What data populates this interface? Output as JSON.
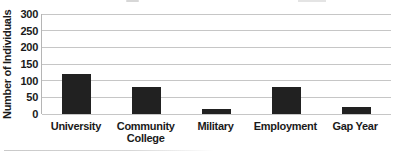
{
  "figure": {
    "background": "#ffffff"
  },
  "chart_data": {
    "type": "bar",
    "title": "",
    "categories": [
      "University",
      "Community College",
      "Military",
      "Employment",
      "Gap Year"
    ],
    "values": [
      120,
      80,
      15,
      80,
      20
    ],
    "xlabel": "",
    "ylabel": "Number of Individuals",
    "ylim": [
      0,
      300
    ],
    "yticks": [
      0,
      50,
      100,
      150,
      200,
      250,
      300
    ],
    "grid": true,
    "legend": false,
    "bar_color": "#212121",
    "gridline_color": "#c6c6c6",
    "axis_line_color": "#b5b5b5",
    "text_color": "#1a1a1a"
  }
}
